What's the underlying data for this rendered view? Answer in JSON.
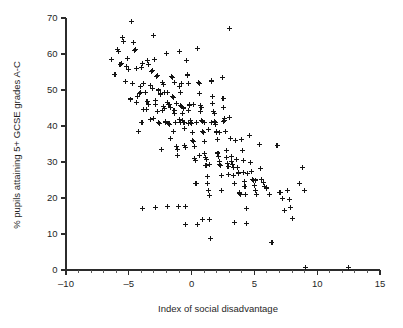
{
  "chart_data": {
    "type": "scatter",
    "title": "",
    "xlabel": "Index of social disadvantage",
    "ylabel": "% pupils attaining 5+ GCSE grades A-C",
    "xlim": [
      -10,
      15
    ],
    "ylim": [
      0,
      70
    ],
    "xticks": [
      -10,
      -5,
      0,
      5,
      10,
      15
    ],
    "xticklabels": [
      "–10",
      "–5",
      "0",
      "5",
      "10",
      "15"
    ],
    "yticks": [
      0,
      10,
      20,
      30,
      40,
      50,
      60,
      70
    ],
    "yticklabels": [
      "0",
      "10",
      "20",
      "30",
      "40",
      "50",
      "60",
      "70"
    ],
    "x_minor_tick_step": 1,
    "grid": false,
    "legend": false,
    "marker": "plus",
    "marker_color": "#141414",
    "marker_size_px": 5,
    "n_points": 243,
    "points": [
      [
        -6.4,
        58.4
      ],
      [
        -6.1,
        54.3
      ],
      [
        -5.9,
        61.3
      ],
      [
        -5.8,
        60.6
      ],
      [
        -5.7,
        57.1
      ],
      [
        -5.6,
        57.3
      ],
      [
        -5.5,
        64.6
      ],
      [
        -5.4,
        63.4
      ],
      [
        -5.2,
        56.6
      ],
      [
        -5.1,
        58.7
      ],
      [
        -5.0,
        55.6
      ],
      [
        -4.9,
        47.5
      ],
      [
        -4.8,
        68.9
      ],
      [
        -4.7,
        51.7
      ],
      [
        -4.6,
        63.2
      ],
      [
        -4.55,
        60.9
      ],
      [
        -4.5,
        61.2
      ],
      [
        -4.4,
        55.9
      ],
      [
        -4.3,
        48.1
      ],
      [
        -4.2,
        38.4
      ],
      [
        -4.1,
        51.0
      ],
      [
        -4.05,
        49.4
      ],
      [
        -4.0,
        56.3
      ],
      [
        -3.9,
        57.4
      ],
      [
        -3.85,
        44.6
      ],
      [
        -3.8,
        51.9
      ],
      [
        -3.7,
        49.3
      ],
      [
        -3.6,
        44.6
      ],
      [
        -3.5,
        58.2
      ],
      [
        -3.45,
        57.1
      ],
      [
        -3.4,
        46.1
      ],
      [
        -3.3,
        41.8
      ],
      [
        -3.2,
        55.1
      ],
      [
        -3.15,
        55.3
      ],
      [
        -3.1,
        50.5
      ],
      [
        -3.0,
        65.1
      ],
      [
        -2.95,
        58.4
      ],
      [
        -2.9,
        47.2
      ],
      [
        -2.85,
        46.0
      ],
      [
        -2.8,
        53.7
      ],
      [
        -2.75,
        53.9
      ],
      [
        -2.7,
        43.9
      ],
      [
        -2.6,
        41.0
      ],
      [
        -2.55,
        40.7
      ],
      [
        -2.5,
        49.1
      ],
      [
        -2.45,
        48.7
      ],
      [
        -2.4,
        33.4
      ],
      [
        -2.3,
        52.1
      ],
      [
        -2.25,
        51.6
      ],
      [
        -2.2,
        45.3
      ],
      [
        -2.15,
        44.9
      ],
      [
        -2.1,
        41.2
      ],
      [
        -2.0,
        60.2
      ],
      [
        -1.95,
        49.4
      ],
      [
        -1.9,
        46.5
      ],
      [
        -1.85,
        45.9
      ],
      [
        -1.8,
        40.8
      ],
      [
        -1.75,
        40.3
      ],
      [
        -1.7,
        36.6
      ],
      [
        -1.6,
        53.8
      ],
      [
        -1.55,
        53.5
      ],
      [
        -1.5,
        48.3
      ],
      [
        -1.45,
        47.9
      ],
      [
        -1.4,
        44.2
      ],
      [
        -1.35,
        43.5
      ],
      [
        -1.3,
        41.1
      ],
      [
        -1.25,
        40.9
      ],
      [
        -1.2,
        34.2
      ],
      [
        -1.15,
        33.6
      ],
      [
        -1.1,
        31.8
      ],
      [
        -1.05,
        17.6
      ],
      [
        -1.0,
        60.6
      ],
      [
        -0.95,
        51.0
      ],
      [
        -0.9,
        49.2
      ],
      [
        -0.85,
        45.8
      ],
      [
        -0.8,
        45.4
      ],
      [
        -0.75,
        43.4
      ],
      [
        -0.7,
        41.5
      ],
      [
        -0.65,
        41.1
      ],
      [
        -0.6,
        39.2
      ],
      [
        -0.55,
        34.7
      ],
      [
        -0.5,
        33.9
      ],
      [
        -0.45,
        17.7
      ],
      [
        -0.4,
        58.2
      ],
      [
        -0.35,
        54.2
      ],
      [
        -0.3,
        53.9
      ],
      [
        -0.25,
        51.7
      ],
      [
        -0.2,
        46.1
      ],
      [
        -0.15,
        45.8
      ],
      [
        -0.1,
        41.4
      ],
      [
        -0.05,
        41.1
      ],
      [
        0.0,
        40.6
      ],
      [
        0.05,
        38.3
      ],
      [
        0.1,
        36.1
      ],
      [
        0.15,
        35.7
      ],
      [
        0.2,
        34.2
      ],
      [
        0.25,
        31.1
      ],
      [
        0.3,
        30.3
      ],
      [
        0.35,
        24.1
      ],
      [
        0.4,
        23.9
      ],
      [
        0.45,
        12.7
      ],
      [
        0.5,
        61.4
      ],
      [
        0.55,
        52.1
      ],
      [
        0.6,
        51.9
      ],
      [
        0.65,
        49.1
      ],
      [
        0.7,
        45.6
      ],
      [
        0.75,
        45.1
      ],
      [
        0.8,
        41.6
      ],
      [
        0.85,
        41.2
      ],
      [
        0.9,
        38.4
      ],
      [
        0.95,
        38.1
      ],
      [
        1.0,
        35.8
      ],
      [
        1.05,
        32.4
      ],
      [
        1.1,
        31.3
      ],
      [
        1.15,
        30.8
      ],
      [
        1.2,
        29.1
      ],
      [
        1.25,
        26.1
      ],
      [
        1.3,
        24.0
      ],
      [
        1.35,
        22.2
      ],
      [
        1.4,
        20.7
      ],
      [
        1.45,
        14.1
      ],
      [
        1.5,
        8.8
      ],
      [
        1.55,
        52.6
      ],
      [
        1.6,
        52.3
      ],
      [
        1.65,
        48.2
      ],
      [
        1.7,
        46.3
      ],
      [
        1.75,
        44.1
      ],
      [
        1.8,
        43.6
      ],
      [
        1.85,
        41.2
      ],
      [
        1.9,
        40.9
      ],
      [
        1.95,
        38.6
      ],
      [
        2.0,
        38.2
      ],
      [
        2.05,
        36.2
      ],
      [
        2.1,
        32.5
      ],
      [
        2.15,
        31.6
      ],
      [
        2.2,
        30.2
      ],
      [
        2.25,
        29.3
      ],
      [
        2.3,
        28.9
      ],
      [
        2.35,
        26.3
      ],
      [
        2.4,
        22.1
      ],
      [
        2.45,
        53.5
      ],
      [
        2.5,
        47.6
      ],
      [
        2.55,
        45.1
      ],
      [
        2.6,
        42.0
      ],
      [
        2.65,
        41.6
      ],
      [
        2.7,
        38.4
      ],
      [
        2.75,
        33.2
      ],
      [
        2.8,
        31.2
      ],
      [
        2.85,
        29.6
      ],
      [
        2.9,
        28.8
      ],
      [
        2.95,
        26.4
      ],
      [
        3.0,
        67.0
      ],
      [
        3.05,
        42.3
      ],
      [
        3.1,
        36.4
      ],
      [
        3.15,
        31.5
      ],
      [
        3.2,
        30.1
      ],
      [
        3.25,
        29.2
      ],
      [
        3.3,
        28.4
      ],
      [
        3.35,
        26.2
      ],
      [
        3.4,
        13.2
      ],
      [
        3.5,
        35.9
      ],
      [
        3.6,
        30.6
      ],
      [
        3.65,
        28.6
      ],
      [
        3.7,
        27.1
      ],
      [
        3.75,
        26.9
      ],
      [
        3.8,
        21.6
      ],
      [
        3.85,
        21.3
      ],
      [
        3.9,
        20.9
      ],
      [
        4.0,
        36.2
      ],
      [
        4.05,
        33.3
      ],
      [
        4.1,
        30.4
      ],
      [
        4.15,
        27.2
      ],
      [
        4.2,
        24.6
      ],
      [
        4.25,
        23.3
      ],
      [
        4.3,
        21.0
      ],
      [
        4.35,
        17.1
      ],
      [
        4.4,
        12.8
      ],
      [
        4.6,
        37.3
      ],
      [
        4.7,
        29.8
      ],
      [
        4.8,
        27.3
      ],
      [
        4.85,
        25.1
      ],
      [
        4.9,
        24.8
      ],
      [
        5.0,
        23.4
      ],
      [
        5.1,
        22.1
      ],
      [
        5.2,
        21.1
      ],
      [
        5.4,
        34.8
      ],
      [
        5.5,
        28.3
      ],
      [
        5.6,
        25.2
      ],
      [
        5.7,
        24.4
      ],
      [
        5.8,
        23.1
      ],
      [
        6.0,
        22.6
      ],
      [
        6.2,
        21.0
      ],
      [
        6.4,
        7.6
      ],
      [
        6.8,
        34.7
      ],
      [
        7.0,
        21.6
      ],
      [
        7.1,
        21.4
      ],
      [
        7.2,
        19.8
      ],
      [
        7.4,
        16.5
      ],
      [
        7.6,
        22.2
      ],
      [
        7.8,
        19.7
      ],
      [
        7.9,
        17.4
      ],
      [
        8.0,
        14.4
      ],
      [
        8.6,
        24.0
      ],
      [
        8.8,
        28.4
      ],
      [
        9.0,
        22.0
      ],
      [
        9.05,
        0.7
      ],
      [
        12.5,
        0.6
      ],
      [
        -5.3,
        52.4
      ],
      [
        -4.35,
        46.6
      ],
      [
        -3.95,
        41.1
      ],
      [
        -3.55,
        46.8
      ],
      [
        -3.05,
        42.1
      ],
      [
        -2.65,
        50.0
      ],
      [
        -2.35,
        44.4
      ],
      [
        -1.65,
        45.2
      ],
      [
        -1.45,
        38.6
      ],
      [
        -0.98,
        41.7
      ],
      [
        -0.68,
        45.0
      ],
      [
        -0.22,
        44.2
      ],
      [
        0.12,
        45.9
      ],
      [
        0.42,
        41.0
      ],
      [
        0.72,
        43.9
      ],
      [
        1.02,
        41.1
      ],
      [
        1.32,
        38.9
      ],
      [
        1.62,
        41.0
      ],
      [
        1.92,
        40.3
      ],
      [
        2.22,
        38.1
      ],
      [
        -2.05,
        41.0
      ],
      [
        -1.78,
        46.0
      ],
      [
        -1.18,
        46.2
      ],
      [
        -0.88,
        41.0
      ],
      [
        -0.58,
        40.9
      ],
      [
        -0.28,
        40.8
      ],
      [
        0.22,
        30.9
      ],
      [
        0.62,
        31.8
      ],
      [
        1.12,
        29.0
      ],
      [
        1.42,
        29.4
      ],
      [
        -4.15,
        49.0
      ],
      [
        -3.25,
        51.3
      ],
      [
        -2.15,
        49.2
      ],
      [
        -1.35,
        52.1
      ],
      [
        -0.78,
        51.9
      ],
      [
        2.52,
        41.2
      ],
      [
        3.45,
        24.0
      ],
      [
        4.45,
        26.8
      ],
      [
        5.05,
        25.0
      ],
      [
        5.95,
        23.0
      ],
      [
        -2.9,
        17.3
      ],
      [
        -3.9,
        17.0
      ],
      [
        -1.9,
        17.6
      ],
      [
        0.85,
        14.0
      ],
      [
        -0.45,
        12.7
      ]
    ]
  },
  "axes": {
    "x_title": "Index of social disadvantage",
    "y_title": "% pupils attaining 5+ GCSE grades A-C"
  }
}
